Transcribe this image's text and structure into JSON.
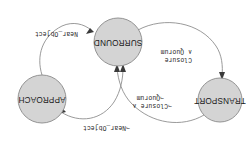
{
  "figure": {
    "kind": "state-transition-diagram",
    "rotation_degrees": 180,
    "background_color": "#ffffff",
    "node_fill_color": "#d4d4d4",
    "node_stroke_color": "#8a8a8a",
    "edge_color": "#8e8e8e",
    "arrow_color": "#3a3a3a",
    "text_color": "#1f1f1f"
  },
  "nodes": [
    {
      "id": "transport",
      "label": "TRANSPORT",
      "cx": 28,
      "cy": 42,
      "r": 22
    },
    {
      "id": "approach",
      "label": "APPROACH",
      "cx": 206,
      "cy": 43,
      "r": 24
    },
    {
      "id": "surround",
      "label": "SURROUND",
      "cx": 130,
      "cy": 100,
      "r": 24
    }
  ],
  "edges": [
    {
      "id": "surround-to-transport",
      "from": "surround",
      "to": "transport",
      "label_line1": "Closure",
      "label_line2": "∧ Quorum",
      "label_x": 56,
      "label_y": 84
    },
    {
      "id": "transport-to-surround",
      "from": "transport",
      "to": "surround",
      "label_line1": "¬Closure ∧",
      "label_line2": "¬Quorum",
      "label_x": 76,
      "label_y": 32
    },
    {
      "id": "approach-to-surround",
      "from": "approach",
      "to": "surround",
      "label_line1": "¬Near_Object",
      "label_line2": "",
      "label_x": 118,
      "label_y": 14
    },
    {
      "id": "surround-to-approach",
      "from": "surround",
      "to": "approach",
      "label_line1": "Near_Object",
      "label_line2": "",
      "label_x": 170,
      "label_y": 108
    }
  ]
}
